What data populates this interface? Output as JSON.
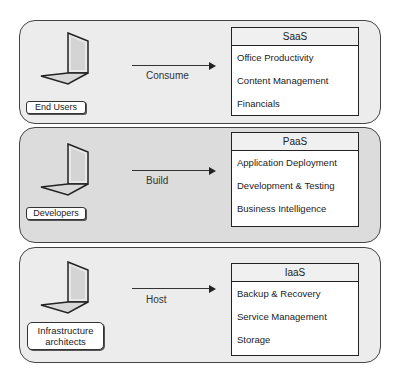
{
  "tiers": [
    {
      "role": "End Users",
      "action": "Consume",
      "service": "SaaS",
      "items": [
        "Office Productivity",
        "Content Management",
        "Financials"
      ]
    },
    {
      "role": "Developers",
      "action": "Build",
      "service": "PaaS",
      "items": [
        "Application Deployment",
        "Development & Testing",
        "Business Intelligence"
      ]
    },
    {
      "role": "Infrastructure architects",
      "action": "Host",
      "service": "IaaS",
      "items": [
        "Backup & Recovery",
        "Service Management",
        "Storage"
      ]
    }
  ],
  "colors": {
    "panel_light": "#ececec",
    "panel_dark": "#dcdcdc",
    "border": "#444444"
  }
}
